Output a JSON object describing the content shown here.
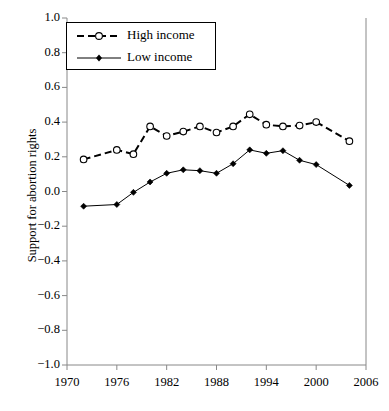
{
  "chart_data": {
    "type": "line",
    "title": "",
    "xlabel": "",
    "ylabel": "Support for abortion rights",
    "xlim": [
      1970,
      2006
    ],
    "ylim": [
      -1.0,
      1.0
    ],
    "grid": false,
    "legend_position": "top-left",
    "xticks": [
      1970,
      1976,
      1982,
      1988,
      1994,
      2000,
      2006
    ],
    "yticks": [
      "1.0",
      "0.8",
      "0.6",
      "0.4",
      "0.2",
      "0.0",
      "−0.2",
      "−0.4",
      "−0.6",
      "−0.8",
      "−1.0"
    ],
    "x": [
      1972,
      1976,
      1978,
      1980,
      1982,
      1984,
      1986,
      1988,
      1990,
      1992,
      1994,
      1996,
      1998,
      2000,
      2004
    ],
    "series": [
      {
        "name": "High income",
        "marker": "open-circle",
        "linestyle": "dashed",
        "color": "#000000",
        "values": [
          0.185,
          0.24,
          0.215,
          0.375,
          0.32,
          0.345,
          0.375,
          0.34,
          0.375,
          0.445,
          0.385,
          0.375,
          0.38,
          0.4,
          0.29
        ]
      },
      {
        "name": "Low income",
        "marker": "filled-diamond",
        "linestyle": "solid",
        "color": "#000000",
        "values": [
          -0.085,
          -0.075,
          -0.005,
          0.055,
          0.105,
          0.125,
          0.12,
          0.105,
          0.16,
          0.24,
          0.22,
          0.235,
          0.18,
          0.155,
          0.035
        ]
      }
    ]
  },
  "legend": {
    "items": [
      {
        "label": "High income"
      },
      {
        "label": "Low income"
      }
    ]
  }
}
